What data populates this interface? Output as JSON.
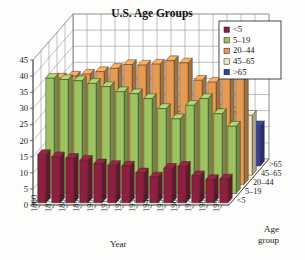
{
  "chart_data": {
    "type": "bar",
    "title": "U.S. Age Groups",
    "xlabel": "Year",
    "ylabel": "",
    "zlabel": "Age group",
    "ylim": [
      0,
      45
    ],
    "yticks": [
      0,
      5,
      10,
      15,
      20,
      25,
      30,
      35,
      40,
      45
    ],
    "grid": true,
    "projection": "3d",
    "legend_position": "top-right",
    "categories": [
      "1860",
      "1870",
      "1880",
      "1890",
      "1900",
      "1910",
      "1920",
      "1930",
      "1940",
      "1950",
      "1960",
      "1970",
      "1980",
      "1990"
    ],
    "series": [
      {
        "name": "<5",
        "color": "#8e1f3e",
        "values": [
          15.0,
          14.3,
          13.8,
          13.2,
          12.1,
          11.6,
          11.4,
          9.3,
          8.0,
          10.7,
          11.3,
          8.4,
          7.2,
          7.4
        ]
      },
      {
        "name": "5-19",
        "color": "#9dc262",
        "values": [
          35.8,
          35.4,
          35.0,
          34.2,
          33.2,
          31.6,
          31.0,
          29.5,
          26.4,
          23.2,
          27.4,
          29.5,
          24.8,
          20.9
        ]
      },
      {
        "name": "20-44",
        "color": "#e79b52",
        "values": [
          33.0,
          33.6,
          34.2,
          35.0,
          36.0,
          37.2,
          37.0,
          37.3,
          38.4,
          37.7,
          32.3,
          31.7,
          37.1,
          40.2
        ]
      },
      {
        "name": "45-65",
        "color": "#f2e6c2",
        "values": [
          11.6,
          12.2,
          12.8,
          13.5,
          14.5,
          15.3,
          15.8,
          17.4,
          19.8,
          20.3,
          20.1,
          20.6,
          19.6,
          18.6
        ]
      },
      {
        "name": ">65",
        "color": "#3a3f9e",
        "values": [
          2.7,
          3.0,
          3.4,
          3.9,
          4.1,
          4.3,
          4.7,
          5.4,
          6.8,
          8.1,
          9.2,
          9.8,
          11.3,
          12.5
        ]
      }
    ],
    "zticks": [
      "<5",
      "5-19",
      "20-44",
      "45-65",
      ">65"
    ]
  },
  "legend": {
    "items": [
      {
        "label": "<5",
        "color": "#8e1f3e"
      },
      {
        "label": "5–19",
        "color": "#9dc262"
      },
      {
        "label": "20–44",
        "color": "#e79b52"
      },
      {
        "label": "45–65",
        "color": "#f2e6c2"
      },
      {
        "label": ">65",
        "color": "#3a3f9e"
      }
    ]
  },
  "axes": {
    "year_title": "Year",
    "age_title_line1": "Age",
    "age_title_line2": "group",
    "y_ticks": [
      "0",
      "5",
      "10",
      "15",
      "20",
      "25",
      "30",
      "35",
      "40",
      "45"
    ],
    "x_ticks": [
      "1860",
      "1870",
      "1880",
      "1890",
      "1900",
      "1910",
      "1920",
      "1930",
      "1940",
      "1950",
      "1960",
      "1970",
      "1980",
      "1990"
    ],
    "z_ticks": [
      "<5",
      "5–19",
      "20–44",
      "45–65",
      ">65"
    ]
  }
}
